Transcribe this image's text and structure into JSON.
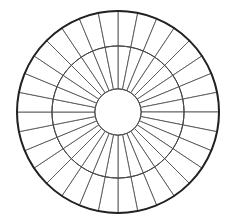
{
  "page": {
    "width": 234,
    "height": 224,
    "background_color": "#ffffff"
  },
  "edge_rule": {
    "name": "page-edge-rule",
    "color": "#c9c9c9",
    "x": 2,
    "width": 1
  },
  "chart_data": {
    "type": "pie",
    "title": "",
    "subtitle": "",
    "xlabel": "",
    "ylabel": "",
    "legend_position": "none",
    "grid": false,
    "variant": "radial-spoke-wheel-blank-template",
    "center": {
      "x": 118,
      "y": 112
    },
    "sector_count": 32,
    "sector_angle_degrees": 11.25,
    "start_angle_degrees": -90,
    "rings": [
      {
        "name": "outer-ring",
        "inner_radius": 66,
        "outer_radius": 101,
        "segments": 32,
        "fill": "#ffffff",
        "stroke": "#555555",
        "stroke_width": 0.9
      },
      {
        "name": "inner-ring",
        "inner_radius": 23,
        "outer_radius": 66,
        "segments": 32,
        "fill": "#ffffff",
        "stroke": "#555555",
        "stroke_width": 0.9
      }
    ],
    "hub": {
      "name": "center-hub",
      "radius": 23,
      "fill": "#ffffff",
      "stroke": "#444444",
      "stroke_width": 1.0,
      "label": ""
    },
    "circles": [
      {
        "name": "outer-boundary-circle",
        "radius": 101,
        "stroke": "#222222",
        "stroke_width": 2.0
      },
      {
        "name": "middle-boundary-circle",
        "radius": 66,
        "stroke": "#444444",
        "stroke_width": 1.0
      },
      {
        "name": "inner-boundary-circle",
        "radius": 23,
        "stroke": "#444444",
        "stroke_width": 1.0
      }
    ],
    "categories": [
      "1",
      "2",
      "3",
      "4",
      "5",
      "6",
      "7",
      "8",
      "9",
      "10",
      "11",
      "12",
      "13",
      "14",
      "15",
      "16",
      "17",
      "18",
      "19",
      "20",
      "21",
      "22",
      "23",
      "24",
      "25",
      "26",
      "27",
      "28",
      "29",
      "30",
      "31",
      "32"
    ],
    "values": [
      1,
      1,
      1,
      1,
      1,
      1,
      1,
      1,
      1,
      1,
      1,
      1,
      1,
      1,
      1,
      1,
      1,
      1,
      1,
      1,
      1,
      1,
      1,
      1,
      1,
      1,
      1,
      1,
      1,
      1,
      1,
      1
    ],
    "labels": [
      "",
      "",
      "",
      "",
      "",
      "",
      "",
      "",
      "",
      "",
      "",
      "",
      "",
      "",
      "",
      "",
      "",
      "",
      "",
      "",
      "",
      "",
      "",
      "",
      "",
      "",
      "",
      "",
      "",
      "",
      "",
      ""
    ],
    "annotations": []
  },
  "colors": {
    "background": "#ffffff",
    "outer_stroke": "#222222",
    "spoke_stroke": "#555555",
    "ring_stroke": "#444444",
    "segment_fill": "#ffffff",
    "edge_rule": "#c9c9c9"
  }
}
